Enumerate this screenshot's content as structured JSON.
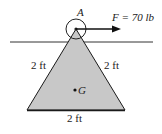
{
  "diagram": {
    "pin_label": "A",
    "centroid_label": "G",
    "force_label": "F = 70 lb",
    "side_left_label": "2 ft",
    "side_right_label": "2 ft",
    "base_label": "2 ft",
    "colors": {
      "triangle_fill": "#c8c8c8",
      "stroke": "#1a1a1a",
      "background": "#ffffff"
    }
  }
}
